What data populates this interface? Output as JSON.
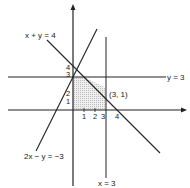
{
  "diagram": {
    "type": "linear-inequalities-feasible-region",
    "lines": [
      {
        "equation": "x + y = 4",
        "label": "x + y = 4"
      },
      {
        "equation": "y = 3",
        "label": "y = 3"
      },
      {
        "equation": "x = 3",
        "label": "x = 3"
      },
      {
        "equation": "2x - y = -3",
        "label": "2x − y = −3"
      }
    ],
    "point": {
      "label": "(3, 1)"
    },
    "x_ticks": [
      "1",
      "2",
      "3",
      "4"
    ],
    "y_ticks": [
      "1",
      "2",
      "3",
      "4"
    ],
    "colors": {
      "line": "#222222",
      "region": "#d9d9d9",
      "background": "#ffffff"
    }
  }
}
